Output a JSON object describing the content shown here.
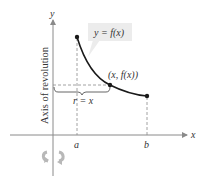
{
  "diagram": {
    "axes": {
      "x_label": "x",
      "y_label": "y",
      "axis_of_revolution_label": "Axis of revolution"
    },
    "curve": {
      "label": "y = f(x)",
      "point_label": "(x, f(x))",
      "endpoints": [
        "a",
        "b"
      ]
    },
    "radius_label": "r = x",
    "tick_labels": {
      "a": "a",
      "b": "b"
    },
    "icons": {
      "rotation": "rotation-arrow-icon"
    },
    "colors": {
      "curve": "#1a1a1a",
      "axis": "#8a8a8a",
      "dashed": "#8a8a8a",
      "label_box": "#ececec",
      "rotation_icon": "#b8b8b8"
    }
  }
}
